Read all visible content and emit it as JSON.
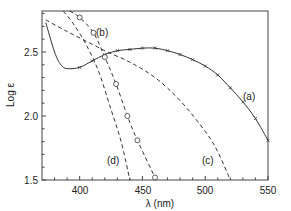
{
  "chart_data": {
    "type": "line",
    "title": "",
    "xlabel": "λ (nm)",
    "ylabel": "Log ε",
    "xlim": [
      370,
      550
    ],
    "ylim": [
      1.5,
      2.82
    ],
    "xticks": [
      400,
      450,
      500,
      550
    ],
    "yticks": [
      1.5,
      2.0,
      2.5
    ],
    "grid": false,
    "legend": "inline curve labels",
    "series": [
      {
        "name": "(a)",
        "style": "solid line with x markers",
        "points": [
          [
            373,
            2.73
          ],
          [
            380,
            2.5
          ],
          [
            385,
            2.4
          ],
          [
            390,
            2.37
          ],
          [
            400,
            2.38
          ],
          [
            410,
            2.43
          ],
          [
            420,
            2.48
          ],
          [
            430,
            2.51
          ],
          [
            440,
            2.52
          ],
          [
            450,
            2.53
          ],
          [
            460,
            2.53
          ],
          [
            470,
            2.51
          ],
          [
            480,
            2.48
          ],
          [
            490,
            2.44
          ],
          [
            500,
            2.39
          ],
          [
            510,
            2.32
          ],
          [
            520,
            2.22
          ],
          [
            530,
            2.11
          ],
          [
            540,
            1.98
          ],
          [
            550,
            1.81
          ]
        ]
      },
      {
        "name": "(b)",
        "style": "dashed line with circle markers",
        "points": [
          [
            392,
            2.84
          ],
          [
            400,
            2.77
          ],
          [
            411,
            2.65
          ],
          [
            420,
            2.46
          ],
          [
            429,
            2.25
          ],
          [
            438,
            2.0
          ],
          [
            446,
            1.81
          ],
          [
            460,
            1.52
          ]
        ]
      },
      {
        "name": "(c)",
        "style": "dashed line",
        "points": [
          [
            373,
            2.75
          ],
          [
            390,
            2.66
          ],
          [
            410,
            2.56
          ],
          [
            422,
            2.5
          ],
          [
            440,
            2.42
          ],
          [
            460,
            2.3
          ],
          [
            480,
            2.12
          ],
          [
            500,
            1.88
          ],
          [
            510,
            1.72
          ],
          [
            520,
            1.5
          ]
        ]
      },
      {
        "name": "(d)",
        "style": "dashed line",
        "points": [
          [
            387,
            2.82
          ],
          [
            395,
            2.72
          ],
          [
            405,
            2.56
          ],
          [
            415,
            2.35
          ],
          [
            425,
            2.05
          ],
          [
            433,
            1.8
          ],
          [
            440,
            1.5
          ]
        ]
      }
    ]
  },
  "labels": {
    "a": "(a)",
    "b": "(b)",
    "c": "(c)",
    "d": "(d)",
    "xlabel": "λ (nm)",
    "ylabel": "Log ε",
    "y15": "1.5",
    "y20": "2.0",
    "y25": "2.5",
    "x400": "400",
    "x450": "450",
    "x500": "500",
    "x550": "550"
  }
}
